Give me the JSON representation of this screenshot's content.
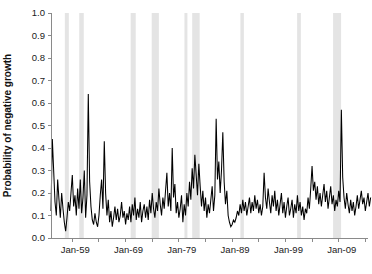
{
  "figure": {
    "background_color": "#ffffff",
    "width": 372,
    "height": 274
  },
  "chart_data": {
    "type": "line",
    "title": "",
    "subtitle": "",
    "xlabel": "",
    "ylabel": "Probability of negative growth",
    "xlim": [
      "Jan-55",
      "Jan-15"
    ],
    "ylim": [
      0.0,
      1.0
    ],
    "grid": false,
    "legend": null,
    "line_color": "#000000",
    "band_color": "#e4e4e4",
    "axis_color": "#8a8a8a",
    "y_ticks": [
      "0.0",
      "0.1",
      "0.2",
      "0.3",
      "0.4",
      "0.5",
      "0.6",
      "0.7",
      "0.8",
      "0.9",
      "1.0"
    ],
    "y_tick_values": [
      0.0,
      0.1,
      0.2,
      0.3,
      0.4,
      0.5,
      0.6,
      0.7,
      0.8,
      0.9,
      1.0
    ],
    "x_tick_labels": [
      "Jan-59",
      "Jan-69",
      "Jan-79",
      "Jan-89",
      "Jan-99",
      "Jan-09"
    ],
    "x_tick_label_years": [
      1959,
      1969,
      1979,
      1989,
      1999,
      2009
    ],
    "x_minor_tick_years": [
      1959,
      1964,
      1969,
      1974,
      1979,
      1984,
      1989,
      1994,
      1999,
      2004,
      2009,
      2014
    ],
    "x_start_year": 1955.0,
    "x_end_year": 2014.5,
    "annotations": [],
    "recession_bands": [
      {
        "label": "1957-58",
        "start": 1957.6,
        "end": 1958.35
      },
      {
        "label": "1960-61",
        "start": 1960.3,
        "end": 1961.15
      },
      {
        "label": "1969-70",
        "start": 1969.95,
        "end": 1970.9
      },
      {
        "label": "1973-75",
        "start": 1973.9,
        "end": 1975.25
      },
      {
        "label": "1980",
        "start": 1980.05,
        "end": 1980.6
      },
      {
        "label": "1981-82",
        "start": 1981.5,
        "end": 1982.9
      },
      {
        "label": "1990-91",
        "start": 1990.55,
        "end": 1991.2
      },
      {
        "label": "2001",
        "start": 2001.2,
        "end": 2001.9
      },
      {
        "label": "2007-09",
        "start": 2007.95,
        "end": 2009.45
      }
    ],
    "series": [
      {
        "name": "Probability of negative growth",
        "x_step_years": 0.25,
        "x_first": 1955.0,
        "values": [
          0.12,
          0.44,
          0.3,
          0.16,
          0.1,
          0.26,
          0.17,
          0.09,
          0.2,
          0.13,
          0.07,
          0.03,
          0.09,
          0.16,
          0.12,
          0.2,
          0.28,
          0.14,
          0.19,
          0.1,
          0.22,
          0.13,
          0.26,
          0.11,
          0.18,
          0.3,
          0.09,
          0.19,
          0.64,
          0.25,
          0.14,
          0.08,
          0.06,
          0.11,
          0.07,
          0.05,
          0.1,
          0.19,
          0.26,
          0.13,
          0.43,
          0.2,
          0.1,
          0.17,
          0.07,
          0.12,
          0.05,
          0.09,
          0.14,
          0.08,
          0.13,
          0.07,
          0.1,
          0.16,
          0.09,
          0.12,
          0.06,
          0.11,
          0.08,
          0.14,
          0.07,
          0.15,
          0.1,
          0.18,
          0.08,
          0.13,
          0.09,
          0.16,
          0.07,
          0.12,
          0.15,
          0.09,
          0.14,
          0.08,
          0.17,
          0.11,
          0.2,
          0.13,
          0.09,
          0.16,
          0.12,
          0.22,
          0.15,
          0.1,
          0.18,
          0.13,
          0.21,
          0.29,
          0.14,
          0.2,
          0.12,
          0.4,
          0.18,
          0.24,
          0.11,
          0.16,
          0.09,
          0.13,
          0.19,
          0.07,
          0.15,
          0.1,
          0.2,
          0.14,
          0.25,
          0.17,
          0.31,
          0.22,
          0.37,
          0.28,
          0.19,
          0.33,
          0.23,
          0.14,
          0.21,
          0.12,
          0.18,
          0.09,
          0.15,
          0.11,
          0.17,
          0.23,
          0.12,
          0.19,
          0.53,
          0.26,
          0.34,
          0.2,
          0.3,
          0.47,
          0.25,
          0.15,
          0.21,
          0.1,
          0.07,
          0.05,
          0.06,
          0.08,
          0.07,
          0.09,
          0.12,
          0.1,
          0.15,
          0.11,
          0.17,
          0.12,
          0.16,
          0.1,
          0.14,
          0.18,
          0.11,
          0.16,
          0.12,
          0.19,
          0.13,
          0.17,
          0.11,
          0.15,
          0.1,
          0.14,
          0.29,
          0.18,
          0.13,
          0.22,
          0.16,
          0.11,
          0.19,
          0.14,
          0.21,
          0.12,
          0.17,
          0.1,
          0.15,
          0.2,
          0.11,
          0.16,
          0.09,
          0.14,
          0.18,
          0.1,
          0.13,
          0.17,
          0.09,
          0.15,
          0.11,
          0.19,
          0.12,
          0.16,
          0.1,
          0.14,
          0.08,
          0.13,
          0.11,
          0.18,
          0.13,
          0.22,
          0.32,
          0.21,
          0.25,
          0.17,
          0.23,
          0.15,
          0.2,
          0.14,
          0.19,
          0.24,
          0.16,
          0.21,
          0.13,
          0.18,
          0.23,
          0.15,
          0.19,
          0.12,
          0.17,
          0.14,
          0.21,
          0.16,
          0.57,
          0.27,
          0.18,
          0.13,
          0.2,
          0.15,
          0.11,
          0.17,
          0.12,
          0.16,
          0.1,
          0.14,
          0.19,
          0.13,
          0.17,
          0.21,
          0.15,
          0.18,
          0.12,
          0.16,
          0.2,
          0.14,
          0.18
        ]
      }
    ]
  },
  "axes": {
    "plot_left_px": 51,
    "plot_right_px": 368,
    "plot_top_px": 13,
    "plot_bottom_px": 238
  }
}
